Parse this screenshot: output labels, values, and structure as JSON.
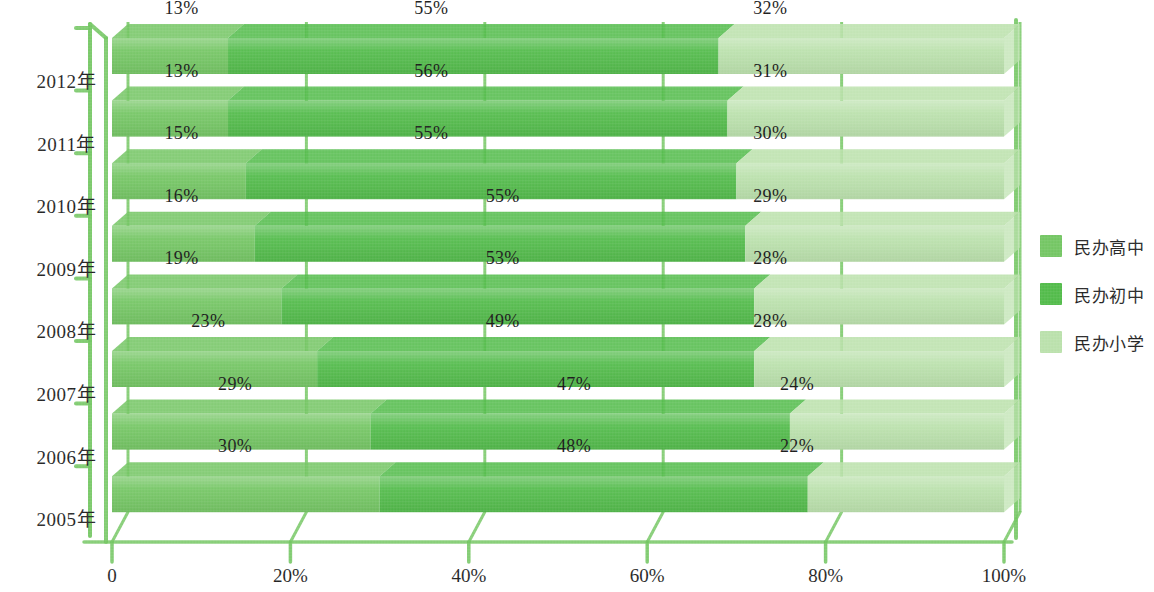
{
  "chart_data": {
    "type": "bar",
    "orientation": "horizontal",
    "stacked": true,
    "normalized_percent": true,
    "title": "",
    "subtitle": "",
    "xlabel": "",
    "ylabel": "",
    "xlim": [
      0,
      100
    ],
    "grid": false,
    "legend_position": "right",
    "categories": [
      "2012年",
      "2011年",
      "2010年",
      "2009年",
      "2008年",
      "2007年",
      "2006年",
      "2005年"
    ],
    "xtick_labels": [
      "0",
      "20%",
      "40%",
      "60%",
      "80%",
      "100%"
    ],
    "xtick_values": [
      0,
      20,
      40,
      60,
      80,
      100
    ],
    "series": [
      {
        "name": "民办高中",
        "color": "#6fc45e",
        "values": [
          13,
          13,
          15,
          16,
          19,
          23,
          29,
          30
        ],
        "labels": [
          "13%",
          "13%",
          "15%",
          "16%",
          "19%",
          "23%",
          "29%",
          "30%"
        ]
      },
      {
        "name": "民办初中",
        "color": "#4cb944",
        "values": [
          55,
          56,
          55,
          55,
          53,
          49,
          47,
          48
        ],
        "labels": [
          "55%",
          "56%",
          "55%",
          "55%",
          "53%",
          "49%",
          "47%",
          "48%"
        ]
      },
      {
        "name": "民办小学",
        "color": "#b8e0a9",
        "values": [
          32,
          31,
          30,
          29,
          28,
          28,
          24,
          22
        ],
        "labels": [
          "32%",
          "31%",
          "30%",
          "29%",
          "28%",
          "28%",
          "24%",
          "22%"
        ]
      }
    ],
    "label_positions_percent": [
      [
        6,
        34,
        72
      ],
      [
        6,
        34,
        72
      ],
      [
        6,
        34,
        72
      ],
      [
        6,
        42,
        72
      ],
      [
        6,
        42,
        72
      ],
      [
        9,
        42,
        72
      ],
      [
        12,
        50,
        75
      ],
      [
        12,
        50,
        75
      ]
    ],
    "axis_color": "#6ec45c"
  },
  "legend": {
    "items": [
      {
        "label": "民办高中",
        "color": "#6fc45e"
      },
      {
        "label": "民办初中",
        "color": "#4cb944"
      },
      {
        "label": "民办小学",
        "color": "#b8e0a9"
      }
    ]
  }
}
